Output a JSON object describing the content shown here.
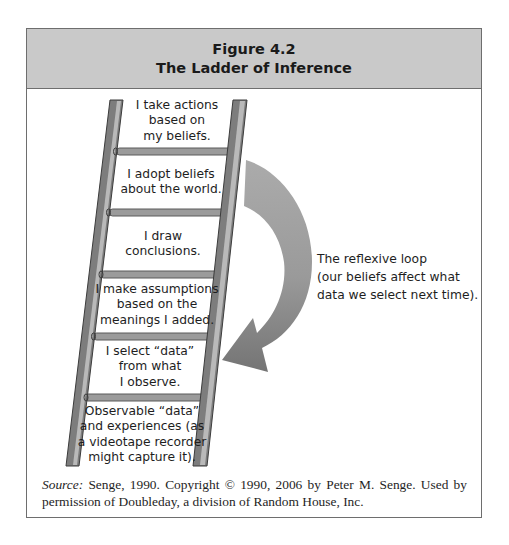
{
  "figure": {
    "number": "Figure 4.2",
    "title": "The Ladder of Inference"
  },
  "ladder": {
    "rungs": [
      {
        "lines": [
          "I take actions",
          "based on",
          "my beliefs."
        ]
      },
      {
        "lines": [
          "I adopt beliefs",
          "about the world."
        ]
      },
      {
        "lines": [
          "I draw",
          "conclusions."
        ]
      },
      {
        "lines": [
          "I make assumptions",
          "based on the",
          "meanings I added."
        ]
      },
      {
        "lines": [
          "I select “data”",
          "from what",
          "I observe."
        ]
      },
      {
        "lines": [
          "Observable “data”",
          "and experiences (as",
          "a videotape recorder",
          "might capture it)."
        ]
      }
    ]
  },
  "reflexive_loop": {
    "lines": [
      "The reflexive loop",
      "(our beliefs affect what",
      "data we select next time)."
    ],
    "arrow_color_top": "#ababab",
    "arrow_color_bottom": "#767676"
  },
  "source": {
    "label": "Source:",
    "text": " Senge, 1990. Copyright © 1990, 2006 by Peter M. Senge. Used by permission of Doubleday, a division of Random House, Inc."
  },
  "colors": {
    "header_bg": "#c9c9c9",
    "border": "#6e6e6e",
    "rail_dark": "#7d7d7d",
    "rail_light": "#b9b9b9",
    "rung": "#9b9b9b"
  }
}
